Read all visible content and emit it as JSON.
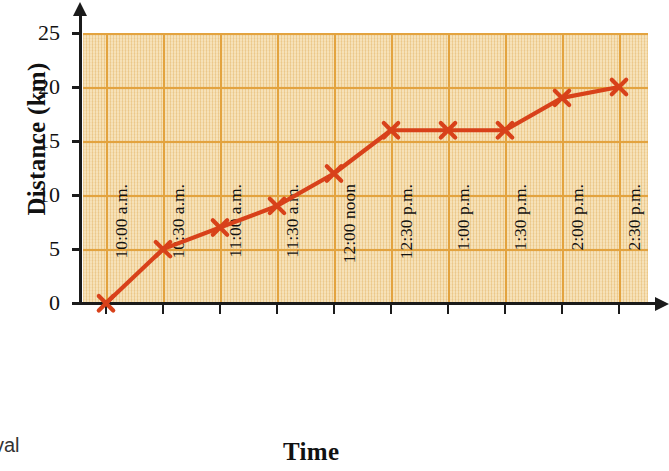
{
  "chart_data": {
    "type": "line",
    "title": "",
    "xlabel": "Time",
    "ylabel": "Distance (km)",
    "categories": [
      "10:00 a.m.",
      "10:30 a.m.",
      "11:00 a.m.",
      "11:30 a.m.",
      "12:00 noon",
      "12:30 p.m.",
      "1:00 p.m.",
      "1:30 p.m.",
      "2:00 p.m.",
      "2:30 p.m."
    ],
    "values": [
      0,
      5,
      7,
      9,
      12,
      16,
      16,
      16,
      19,
      20
    ],
    "series": [
      {
        "name": "Distance travelled",
        "values": [
          0,
          5,
          7,
          9,
          12,
          16,
          16,
          16,
          19,
          20
        ]
      }
    ],
    "ylim": [
      0,
      25
    ],
    "yticks": [
      0,
      5,
      10,
      15,
      20,
      25
    ],
    "ytick_labels": [
      "0",
      "5",
      "10",
      "15",
      "20",
      "25"
    ],
    "grid": true,
    "legend": "none",
    "marker": "x",
    "colors": {
      "line": "#d8411a",
      "marker": "#d8411a",
      "plot_background": "#f3d79f",
      "gridline": "#e3a33f",
      "axis": "#1b1b1b",
      "text": "#111111"
    }
  },
  "labels": {
    "y_axis_title": "Distance (km)",
    "x_axis_title": "Time",
    "corner_fragment": "val"
  }
}
